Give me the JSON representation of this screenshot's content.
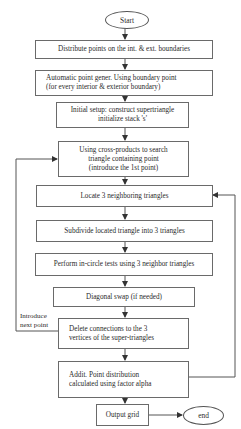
{
  "diagram": {
    "type": "flowchart",
    "start": {
      "label": "Start"
    },
    "end": {
      "label": "end"
    },
    "steps": [
      {
        "id": "distribute",
        "label": "Distribute points on the int.  & ext. boundaries"
      },
      {
        "id": "auto-gen",
        "label": "Automatic point gener. Using boundary point\n(for every interior & exterior boundary)"
      },
      {
        "id": "initial-setup",
        "label": "Initial setup:  construct supertriangle\ninitialize stack  's'"
      },
      {
        "id": "cross-products",
        "label": "Using cross-products to search\ntriangle containing point\n(introduce the 1st point)"
      },
      {
        "id": "locate",
        "label": "Locate 3 neighboring triangles"
      },
      {
        "id": "subdivide",
        "label": "Subdivide located triangle into 3 triangles"
      },
      {
        "id": "in-circle",
        "label": "Perform in-circle tests using 3 neighbor triangles"
      },
      {
        "id": "diagonal-swap",
        "label": "Diagonal swap (if needed)"
      },
      {
        "id": "delete-connections",
        "label": "Delete connections to the 3\nvertices of the super-triangles"
      },
      {
        "id": "addit-distribution",
        "label": "Addit. Point distribution\ncalculated using factor alpha"
      },
      {
        "id": "output-grid",
        "label": "Output grid"
      }
    ],
    "loops": [
      {
        "from": "delete-connections",
        "to": "cross-products",
        "label": "Introduce\nnext point"
      },
      {
        "from": "addit-distribution",
        "to": "locate",
        "label": ""
      }
    ],
    "colors": {
      "line": "#555555",
      "box_border": "#6a6a6a",
      "text": "#2a2a2a",
      "background": "#ffffff"
    }
  }
}
